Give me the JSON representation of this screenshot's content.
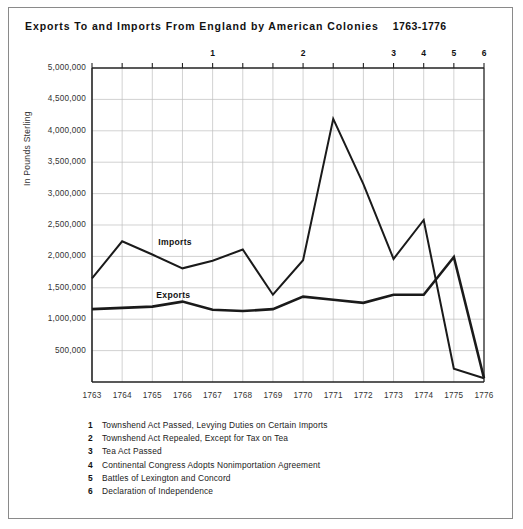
{
  "title": {
    "main": "Exports To and Imports From England by American Colonies",
    "years": "1763-1776"
  },
  "axis": {
    "ylabel": "In Pounds Sterling",
    "yticks": [
      "5,000,000",
      "4,500,000",
      "4,000,000",
      "3,500,000",
      "3,000,000",
      "2,500,000",
      "2,000,000",
      "1,500,000",
      "1,000,000",
      "500,000"
    ],
    "xticks": [
      "1763",
      "1764",
      "1765",
      "1766",
      "1767",
      "1768",
      "1769",
      "1770",
      "1771",
      "1772",
      "1773",
      "1774",
      "1775",
      "1776"
    ]
  },
  "event_markers": [
    {
      "num": "1",
      "year": "1767"
    },
    {
      "num": "2",
      "year": "1770"
    },
    {
      "num": "3",
      "year": "1773"
    },
    {
      "num": "4",
      "year": "1774"
    },
    {
      "num": "5",
      "year": "1775"
    },
    {
      "num": "6",
      "year": "1776"
    }
  ],
  "notes": [
    {
      "num": "1",
      "text": "Townshend Act Passed, Levying Duties on Certain Imports"
    },
    {
      "num": "2",
      "text": "Townshend Act Repealed, Except for Tax on Tea"
    },
    {
      "num": "3",
      "text": "Tea Act Passed"
    },
    {
      "num": "4",
      "text": "Continental Congress Adopts Nonimportation Agreement"
    },
    {
      "num": "5",
      "text": "Battles of Lexington and Concord"
    },
    {
      "num": "6",
      "text": "Declaration of Independence"
    }
  ],
  "series_labels": {
    "imports": "Imports",
    "exports": "Exports"
  },
  "colors": {
    "line": "#1a1a1a",
    "grid": "#bfbfbf",
    "frame": "#8a8a8a",
    "axis": "#222222"
  },
  "chart_data": {
    "type": "line",
    "xlabel": "",
    "ylabel": "In Pounds Sterling",
    "x": [
      1763,
      1764,
      1765,
      1766,
      1767,
      1768,
      1769,
      1770,
      1771,
      1772,
      1773,
      1774,
      1775,
      1776
    ],
    "ylim": [
      0,
      5000000
    ],
    "ytick_step": 500000,
    "grid": true,
    "legend": "inline-labels",
    "series": [
      {
        "name": "Imports",
        "values": [
          1650000,
          2240000,
          2030000,
          1810000,
          1930000,
          2110000,
          1390000,
          1940000,
          4190000,
          3150000,
          1960000,
          2580000,
          210000,
          60000
        ]
      },
      {
        "name": "Exports",
        "values": [
          1160000,
          1180000,
          1200000,
          1280000,
          1150000,
          1130000,
          1160000,
          1360000,
          1310000,
          1260000,
          1390000,
          1390000,
          1990000,
          60000
        ]
      }
    ],
    "annotations": [
      {
        "num": 1,
        "year": 1767,
        "text": "Townshend Act Passed, Levying Duties on Certain Imports"
      },
      {
        "num": 2,
        "year": 1770,
        "text": "Townshend Act Repealed, Except for Tax on Tea"
      },
      {
        "num": 3,
        "year": 1773,
        "text": "Tea Act Passed"
      },
      {
        "num": 4,
        "year": 1774,
        "text": "Continental Congress Adopts Nonimportation Agreement"
      },
      {
        "num": 5,
        "year": 1775,
        "text": "Battles of Lexington and Concord"
      },
      {
        "num": 6,
        "year": 1776,
        "text": "Declaration of Independence"
      }
    ]
  }
}
